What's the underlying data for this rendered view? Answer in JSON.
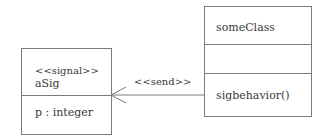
{
  "diagram": {
    "type": "UML class diagram",
    "signal_class": {
      "stereotype": "<<signal>>",
      "name": "aSig",
      "attributes": [
        "p : integer"
      ]
    },
    "target_class": {
      "name": "someClass",
      "attributes": [],
      "operations": [
        "sigbehavior()"
      ]
    },
    "dependency": {
      "label": "<<send>>",
      "from": "someClass",
      "to": "aSig",
      "arrow": "open-arrowhead"
    },
    "colors": {
      "line": "#7a7a7a",
      "text": "#3a3a3a",
      "background": "#ffffff"
    }
  }
}
